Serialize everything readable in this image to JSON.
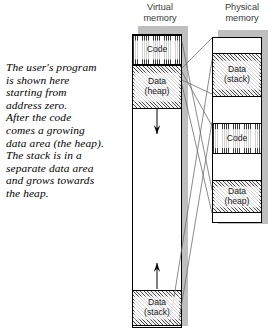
{
  "caption": {
    "lines": [
      "The user's program",
      "is shown here",
      "starting from",
      "address zero.",
      "After the code",
      "comes a growing",
      "data area (the heap).",
      "The stack is in a",
      "separate data area",
      "and grows towards",
      "the heap."
    ]
  },
  "columns": {
    "virtual": {
      "header_line1": "Virtual",
      "header_line2": "memory",
      "blocks": [
        {
          "label_line1": "Code",
          "label_line2": "",
          "fill": "hatch-vert",
          "top": 0,
          "height": 30
        },
        {
          "label_line1": "Data",
          "label_line2": "(heap)",
          "fill": "hatch-diag",
          "top": 30,
          "height": 44
        },
        {
          "label_line1": "",
          "label_line2": "",
          "fill": "blank",
          "top": 74,
          "height": 181
        },
        {
          "label_line1": "Data",
          "label_line2": "(stack)",
          "fill": "hatch-diag",
          "top": 255,
          "height": 36
        }
      ]
    },
    "physical": {
      "header_line1": "Physical",
      "header_line2": "memory",
      "blocks": [
        {
          "label_line1": "",
          "label_line2": "",
          "fill": "blank",
          "top": 0,
          "height": 15
        },
        {
          "label_line1": "Data",
          "label_line2": "(stack)",
          "fill": "hatch-diag",
          "top": 15,
          "height": 44
        },
        {
          "label_line1": "",
          "label_line2": "",
          "fill": "blank",
          "top": 59,
          "height": 26
        },
        {
          "label_line1": "Code",
          "label_line2": "",
          "fill": "hatch-vert",
          "top": 85,
          "height": 31
        },
        {
          "label_line1": "",
          "label_line2": "",
          "fill": "blank",
          "top": 116,
          "height": 26
        },
        {
          "label_line1": "Data",
          "label_line2": "(heap)",
          "fill": "hatch-diag",
          "top": 142,
          "height": 33
        },
        {
          "label_line1": "",
          "label_line2": "",
          "fill": "blank",
          "top": 175,
          "height": 8
        }
      ]
    }
  },
  "arrows": [
    {
      "name": "heap-growth-arrow",
      "direction": "down",
      "x": 157,
      "y_start": 108,
      "y_end": 134
    },
    {
      "name": "stack-growth-arrow",
      "direction": "up",
      "x": 157,
      "y_start": 289,
      "y_end": 263
    }
  ],
  "connectors": [
    {
      "from_x": 182,
      "from_y": 42,
      "to_x": 212,
      "to_y": 190
    },
    {
      "from_x": 182,
      "from_y": 68,
      "to_x": 212,
      "to_y": 38
    },
    {
      "from_x": 182,
      "from_y": 72,
      "to_x": 212,
      "to_y": 126
    },
    {
      "from_x": 182,
      "from_y": 80,
      "to_x": 212,
      "to_y": 94
    },
    {
      "from_x": 182,
      "from_y": 85,
      "to_x": 212,
      "to_y": 213
    },
    {
      "from_x": 170,
      "from_y": 322,
      "to_x": 212,
      "to_y": 60
    },
    {
      "from_x": 179,
      "from_y": 320,
      "to_x": 212,
      "to_y": 122
    }
  ],
  "colors": {
    "outline": "#000000",
    "shadow": "#bfbfbf",
    "header_text": "#3a3a3a",
    "connector": "#6d6d6d",
    "caption_text": "#000000"
  }
}
